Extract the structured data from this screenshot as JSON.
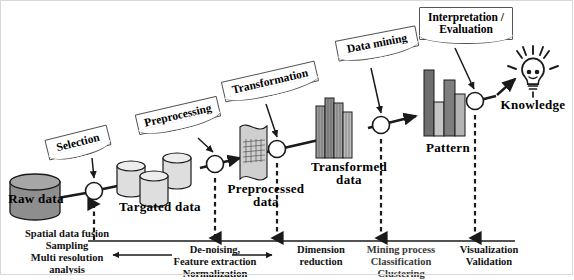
{
  "diagram": {
    "colors": {
      "raw_data_fill": "#8a8a8a",
      "targated_fill": "#d9d9d9",
      "preprocessed_fill": "#c9c9c9",
      "transformed_fill": "#9b9b9b",
      "pattern_dark": "#6f6f6f",
      "pattern_mid": "#8f8f8f",
      "pattern_light": "#c4c4c4",
      "line": "#1a1a1a",
      "callout_border": "#555555",
      "frame": "#d8d8d8"
    },
    "callouts": [
      {
        "id": "selection",
        "label": "Selection"
      },
      {
        "id": "preprocessing",
        "label": "Preprocessing"
      },
      {
        "id": "transformation",
        "label": "Transformation"
      },
      {
        "id": "data-mining",
        "label": "Data mining"
      },
      {
        "id": "interpretation",
        "label": "Interpretation /\nEvaluation",
        "line1": "Interpretation /",
        "line2": "Evaluation"
      }
    ],
    "stages": [
      {
        "id": "raw-data",
        "label": "Raw data"
      },
      {
        "id": "targated-data",
        "label": "Targated data"
      },
      {
        "id": "preprocessed-data",
        "line1": "Preprocessed",
        "line2": "data"
      },
      {
        "id": "transformed-data",
        "line1": "Transformed",
        "line2": "data"
      },
      {
        "id": "pattern",
        "label": "Pattern"
      },
      {
        "id": "knowledge",
        "label": "Knowledge"
      }
    ],
    "bottom_annotations": [
      {
        "id": "ann-selection",
        "lines": [
          "Spatial data fusion",
          "Sampling",
          "Multi resolution",
          "analysis"
        ]
      },
      {
        "id": "ann-preprocessing",
        "lines": [
          "De-noising,",
          "Feature extraction",
          "Normalization"
        ]
      },
      {
        "id": "ann-transformation",
        "lines": [
          "Dimension",
          "reduction"
        ]
      },
      {
        "id": "ann-mining",
        "lines": [
          "Mining process",
          "Classification",
          "Clustering"
        ]
      },
      {
        "id": "ann-interpretation",
        "lines": [
          "Visualization",
          "Validation"
        ]
      }
    ]
  }
}
